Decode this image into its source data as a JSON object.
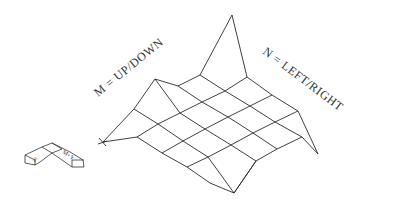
{
  "diagram": {
    "type": "wireframe-surface",
    "labels": {
      "m_axis": "M = UP/DOWN",
      "n_axis": "N = LEFT/RIGHT"
    },
    "axis_icon": {
      "left_glyph": "X",
      "right_glyph": "M+Y"
    },
    "colors": {
      "line": "#2a2a2a",
      "text": "#333333",
      "background": "#ffffff"
    },
    "mesh": {
      "up_right_lines": [
        [
          [
            103,
            142
          ],
          [
            134,
            109
          ],
          [
            155,
            79
          ]
        ],
        [
          [
            155,
            79
          ],
          [
            178,
            86
          ],
          [
            200,
            75
          ]
        ],
        [
          [
            137,
            137
          ],
          [
            158,
            124
          ],
          [
            180,
            113
          ],
          [
            202,
            102
          ],
          [
            225,
            91
          ],
          [
            247,
            77
          ]
        ],
        [
          [
            162,
            153
          ],
          [
            183,
            141
          ],
          [
            205,
            129
          ],
          [
            228,
            117
          ],
          [
            250,
            106
          ],
          [
            272,
            95
          ]
        ],
        [
          [
            187,
            167
          ],
          [
            208,
            157
          ],
          [
            231,
            145
          ],
          [
            253,
            133
          ],
          [
            275,
            122
          ],
          [
            298,
            111
          ]
        ],
        [
          [
            234,
            193
          ],
          [
            256,
            161
          ],
          [
            277,
            149
          ],
          [
            302,
            137
          ],
          [
            318,
            154
          ]
        ]
      ],
      "down_right_lines": [
        [
          [
            103,
            142
          ],
          [
            137,
            137
          ],
          [
            162,
            153
          ],
          [
            187,
            167
          ],
          [
            210,
            183
          ],
          [
            234,
            193
          ]
        ],
        [
          [
            134,
            109
          ],
          [
            158,
            124
          ],
          [
            183,
            141
          ],
          [
            208,
            157
          ],
          [
            234,
            193
          ]
        ],
        [
          [
            155,
            79
          ],
          [
            180,
            113
          ],
          [
            205,
            129
          ],
          [
            231,
            145
          ],
          [
            256,
            161
          ],
          [
            234,
            193
          ]
        ],
        [
          [
            178,
            86
          ],
          [
            202,
            102
          ],
          [
            228,
            117
          ],
          [
            253,
            133
          ],
          [
            277,
            149
          ]
        ],
        [
          [
            200,
            75
          ],
          [
            225,
            91
          ],
          [
            250,
            106
          ],
          [
            275,
            122
          ],
          [
            302,
            137
          ]
        ],
        [
          [
            200,
            75
          ],
          [
            232,
            15
          ],
          [
            247,
            77
          ],
          [
            272,
            95
          ],
          [
            298,
            111
          ],
          [
            318,
            154
          ]
        ]
      ],
      "tips": {
        "left": [
          103,
          142
        ],
        "top": [
          232,
          15
        ],
        "right": [
          318,
          154
        ],
        "bottom": [
          234,
          193
        ]
      }
    }
  }
}
